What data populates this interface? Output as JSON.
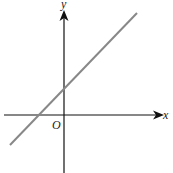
{
  "diagram": {
    "type": "coordinate-plane-line",
    "axes": {
      "x_label": "x",
      "y_label": "y",
      "origin_label": "O",
      "axis_color": "#111111"
    },
    "line": {
      "color": "#888888",
      "description": "straight line with positive slope, positive y-intercept, negative x-intercept"
    }
  }
}
